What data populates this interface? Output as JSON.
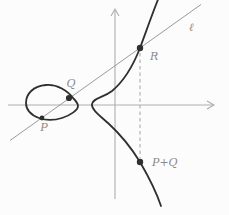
{
  "diagram": {
    "labels": {
      "line": "ℓ",
      "point_p": "P",
      "point_q": "Q",
      "point_r": "R",
      "point_p_plus_q": "P+Q"
    },
    "colors": {
      "background": "#fcfcfc",
      "curve": "#2f2f2f",
      "line": "#8f8f8f",
      "axis": "#adadad",
      "dashed": "#9a9a9a",
      "label": "#8a8a8a"
    }
  }
}
